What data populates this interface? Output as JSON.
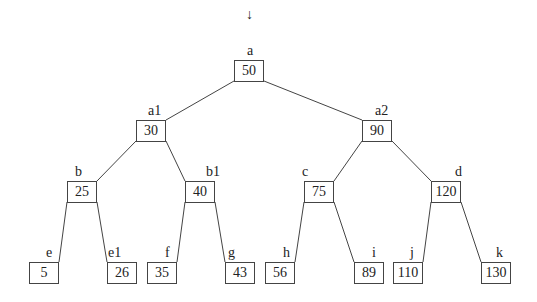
{
  "diagram": {
    "entry_arrow": "↓",
    "nodes": [
      {
        "id": "a",
        "label": "a",
        "value": "50",
        "x": 234,
        "y": 60,
        "lx": 247,
        "ly": 44
      },
      {
        "id": "a1",
        "label": "a1",
        "value": "30",
        "x": 136,
        "y": 120,
        "lx": 148,
        "ly": 104
      },
      {
        "id": "a2",
        "label": "a2",
        "value": "90",
        "x": 362,
        "y": 120,
        "lx": 375,
        "ly": 104
      },
      {
        "id": "b",
        "label": "b",
        "value": "25",
        "x": 67,
        "y": 181,
        "lx": 75,
        "ly": 165
      },
      {
        "id": "b1",
        "label": "b1",
        "value": "40",
        "x": 185,
        "y": 181,
        "lx": 206,
        "ly": 165
      },
      {
        "id": "c",
        "label": "c",
        "value": "75",
        "x": 304,
        "y": 181,
        "lx": 302,
        "ly": 165
      },
      {
        "id": "d",
        "label": "d",
        "value": "120",
        "x": 431,
        "y": 181,
        "lx": 455,
        "ly": 165
      },
      {
        "id": "e",
        "label": "e",
        "value": "5",
        "x": 29,
        "y": 262,
        "lx": 46,
        "ly": 246
      },
      {
        "id": "e1",
        "label": "e1",
        "value": "26",
        "x": 107,
        "y": 262,
        "lx": 108,
        "ly": 246
      },
      {
        "id": "f",
        "label": "f",
        "value": "35",
        "x": 147,
        "y": 262,
        "lx": 165,
        "ly": 246
      },
      {
        "id": "g",
        "label": "g",
        "value": "43",
        "x": 225,
        "y": 262,
        "lx": 228,
        "ly": 246
      },
      {
        "id": "h",
        "label": "h",
        "value": "56",
        "x": 265,
        "y": 262,
        "lx": 283,
        "ly": 246
      },
      {
        "id": "i",
        "label": "i",
        "value": "89",
        "x": 354,
        "y": 262,
        "lx": 372,
        "ly": 246
      },
      {
        "id": "j",
        "label": "j",
        "value": "110",
        "x": 393,
        "y": 262,
        "lx": 410,
        "ly": 246
      },
      {
        "id": "k",
        "label": "k",
        "value": "130",
        "x": 481,
        "y": 262,
        "lx": 496,
        "ly": 246
      }
    ],
    "edges": [
      [
        "a",
        "a1"
      ],
      [
        "a",
        "a2"
      ],
      [
        "a1",
        "b"
      ],
      [
        "a1",
        "b1"
      ],
      [
        "a2",
        "c"
      ],
      [
        "a2",
        "d"
      ],
      [
        "b",
        "e"
      ],
      [
        "b",
        "e1"
      ],
      [
        "b1",
        "f"
      ],
      [
        "b1",
        "g"
      ],
      [
        "c",
        "h"
      ],
      [
        "c",
        "i"
      ],
      [
        "d",
        "j"
      ],
      [
        "d",
        "k"
      ]
    ],
    "colors": {
      "stroke": "#444444",
      "text": "#222222",
      "background": "#ffffff"
    }
  }
}
